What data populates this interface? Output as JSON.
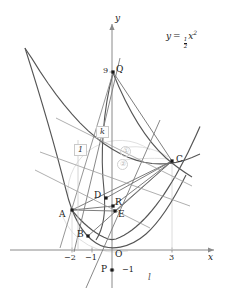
{
  "figure": {
    "axes": {
      "x_label": "x",
      "y_label": "y",
      "origin_label": "O",
      "x_ticks": [
        {
          "value": -2,
          "label": "−2"
        },
        {
          "value": -1,
          "label": "−1"
        },
        {
          "value": 3,
          "label": "3"
        }
      ],
      "y_ticks": [
        {
          "value": 9,
          "label": "9"
        },
        {
          "value": -1,
          "label": "−1"
        }
      ]
    },
    "equation_label": {
      "lhs": "y",
      "eq": "=",
      "num": "1",
      "den": "2",
      "var": "x",
      "exp": "2"
    },
    "line_labels": [
      {
        "name": "k",
        "text": "k"
      },
      {
        "name": "l",
        "text": "l"
      },
      {
        "name": "one",
        "text": "1"
      }
    ],
    "annotations": [
      {
        "name": "callout-1",
        "text": "①"
      },
      {
        "name": "callout-2",
        "text": "②"
      }
    ],
    "points": [
      {
        "name": "A",
        "label": "A",
        "x": -2,
        "y": 2,
        "px": 72,
        "py": 210
      },
      {
        "name": "B",
        "label": "B",
        "x": -1.2,
        "y": 0.72,
        "px": 88,
        "py": 236
      },
      {
        "name": "C",
        "label": "C",
        "x": 3,
        "y": 4.5,
        "px": 172,
        "py": 161
      },
      {
        "name": "D",
        "label": "D",
        "x": -0.3,
        "y": 2.6,
        "px": 106,
        "py": 198
      },
      {
        "name": "E",
        "label": "E",
        "x": 0.15,
        "y": 1.95,
        "px": 115,
        "py": 211
      },
      {
        "name": "P",
        "label": "P",
        "x": 0,
        "y": -1,
        "px": 112,
        "py": 270
      },
      {
        "name": "Q",
        "label": "Q",
        "x": 0,
        "y": 9,
        "px": 113,
        "py": 72
      },
      {
        "name": "R",
        "label": "R",
        "x": 0.1,
        "y": 2.2,
        "px": 113,
        "py": 206
      }
    ]
  },
  "colors": {
    "curve": "#555555",
    "axis": "#8a8a8a",
    "line": "#777777",
    "accent_gray": "#c2c2c2",
    "point": "#1a1a1a",
    "text": "#1a1a1a"
  }
}
